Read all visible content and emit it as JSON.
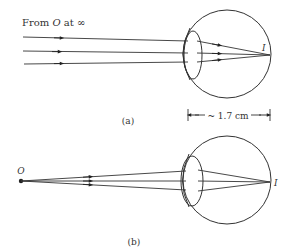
{
  "figure_a": {
    "source_label_prefix": "From ",
    "source_label_object": "O",
    "source_label_suffix": " at ∞",
    "image_label": "I",
    "dimension_label": "~ 1.7 cm",
    "caption": "(a)"
  },
  "figure_b": {
    "object_label": "O",
    "image_label": "I",
    "caption": "(b)"
  },
  "colors": {
    "stroke": "#333333",
    "background": "#ffffff"
  }
}
